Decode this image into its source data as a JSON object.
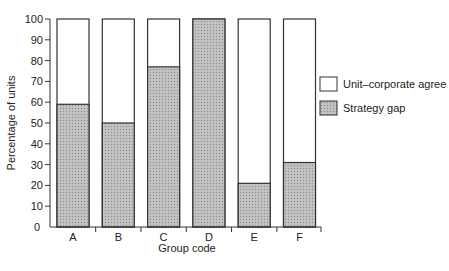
{
  "chart_data": {
    "type": "bar",
    "stacked": true,
    "title": "",
    "xlabel": "Group code",
    "ylabel": "Percentage of units",
    "ylim": [
      0,
      100
    ],
    "yticks": [
      0,
      10,
      20,
      30,
      40,
      50,
      60,
      70,
      80,
      90,
      100
    ],
    "categories": [
      "A",
      "B",
      "C",
      "D",
      "E",
      "F"
    ],
    "series": [
      {
        "name": "Strategy gap",
        "values": [
          59,
          50,
          77,
          100,
          21,
          31
        ],
        "fill": "#b8b8b8",
        "pattern": "dotted-hatch"
      },
      {
        "name": "Unit–corporate agree",
        "values": [
          41,
          50,
          23,
          0,
          79,
          69
        ],
        "fill": "#ffffff"
      }
    ],
    "grid": false,
    "legend": {
      "position": "right",
      "entries": [
        "Unit–corporate agree",
        "Strategy gap"
      ]
    }
  },
  "colors": {
    "gap_fill": "#b8b8b8",
    "agree_fill": "#ffffff",
    "stroke": "#333333"
  }
}
